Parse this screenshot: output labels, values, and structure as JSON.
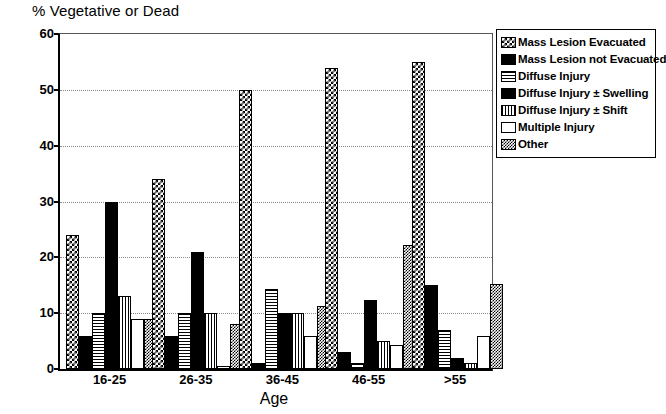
{
  "chart_data": {
    "type": "bar",
    "title": "% Vegetative or Dead",
    "xlabel": "Age",
    "ylabel": "",
    "ylim": [
      0,
      60
    ],
    "yticks": [
      0,
      10,
      20,
      30,
      40,
      50,
      60
    ],
    "grid": true,
    "legend_position": "right",
    "categories": [
      "16-25",
      "26-35",
      "36-45",
      "46-55",
      ">55"
    ],
    "series": [
      {
        "name": "Mass Lesion Evacuated",
        "pattern": "checker",
        "values": [
          24,
          34,
          50,
          54,
          55
        ]
      },
      {
        "name": "Mass Lesion not Evacuated",
        "pattern": "solid",
        "values": [
          6,
          6,
          1,
          3,
          15
        ]
      },
      {
        "name": "Diffuse Injury",
        "pattern": "hlines",
        "values": [
          10,
          10,
          14.3,
          1,
          7
        ]
      },
      {
        "name": "Diffuse Injury ± Swelling",
        "pattern": "solid",
        "values": [
          30,
          21,
          10,
          12.3,
          2
        ]
      },
      {
        "name": "Diffuse Injury ± Shift",
        "pattern": "vlines",
        "values": [
          13,
          10,
          10,
          5,
          1
        ]
      },
      {
        "name": "Multiple Injury",
        "pattern": "white",
        "values": [
          9,
          0.5,
          6,
          4.3,
          6
        ]
      },
      {
        "name": "Other",
        "pattern": "stipple",
        "values": [
          9,
          8,
          11.3,
          22.3,
          15.3
        ]
      }
    ]
  },
  "legend": {
    "items": [
      {
        "label": "Mass Lesion Evacuated",
        "swatch": "checker-swatch"
      },
      {
        "label": "Mass Lesion not Evacuated",
        "swatch": "solid-black-swatch"
      },
      {
        "label": "Diffuse Injury",
        "swatch": "horizontal-lines-swatch"
      },
      {
        "label": "Diffuse Injury ± Swelling",
        "swatch": "solid-black-swatch"
      },
      {
        "label": "Diffuse Injury ± Shift",
        "swatch": "vertical-lines-swatch"
      },
      {
        "label": "Multiple Injury",
        "swatch": "white-swatch"
      },
      {
        "label": "Other",
        "swatch": "stipple-swatch"
      }
    ]
  },
  "colors": {
    "foreground": "#000000",
    "background": "#ffffff",
    "gridline": "#8a8a8a"
  }
}
